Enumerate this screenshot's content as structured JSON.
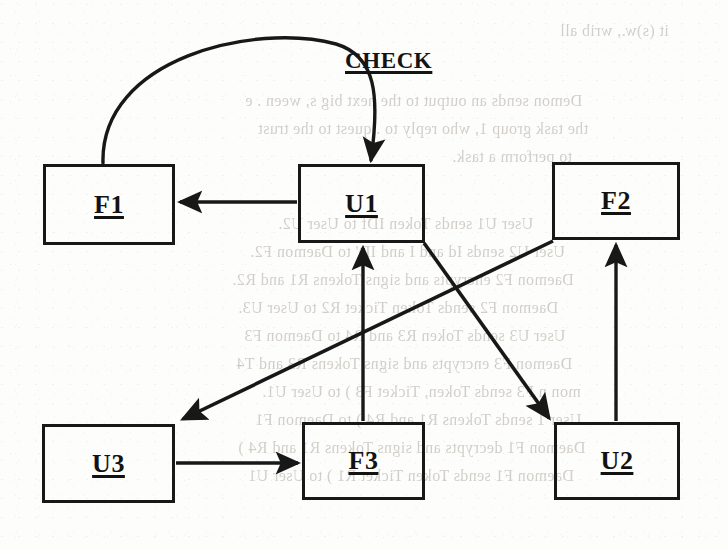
{
  "page": {
    "width": 728,
    "height": 549,
    "background_color": "#fdfdfb",
    "ink_color": "#181818",
    "bleed_color": "#b9b4ad"
  },
  "diagram": {
    "type": "flow-diagram",
    "title": "",
    "nodes": [
      {
        "id": "F1",
        "label": "F1",
        "x": 43,
        "y": 164,
        "w": 132,
        "h": 81,
        "underlined": true
      },
      {
        "id": "U1",
        "label": "U1",
        "x": 298,
        "y": 164,
        "w": 127,
        "h": 79,
        "underlined": true
      },
      {
        "id": "F2",
        "label": "F2",
        "x": 552,
        "y": 162,
        "w": 128,
        "h": 78,
        "underlined": true
      },
      {
        "id": "U3",
        "label": "U3",
        "x": 42,
        "y": 424,
        "w": 133,
        "h": 79,
        "underlined": true
      },
      {
        "id": "F3",
        "label": "F3",
        "x": 302,
        "y": 422,
        "w": 123,
        "h": 78,
        "underlined": true
      },
      {
        "id": "U2",
        "label": "U2",
        "x": 554,
        "y": 422,
        "w": 126,
        "h": 78,
        "underlined": true
      }
    ],
    "edges": [
      {
        "id": "e-f1-u1",
        "from": "F1",
        "to": "U1",
        "shape": "arc",
        "label": "CHECK",
        "arrowhead": "end"
      },
      {
        "id": "e-u1-f1",
        "from": "U1",
        "to": "F1",
        "shape": "horizontal",
        "label": "",
        "arrowhead": "end"
      },
      {
        "id": "e-f3-u1",
        "from": "F3",
        "to": "U1",
        "shape": "vertical",
        "label": "",
        "arrowhead": "end"
      },
      {
        "id": "e-f2-u3",
        "from": "F2",
        "to": "U3",
        "shape": "diagonal",
        "label": "",
        "arrowhead": "end"
      },
      {
        "id": "e-u1-u2",
        "from": "U1",
        "to": "U2",
        "shape": "diagonal",
        "label": "",
        "arrowhead": "end"
      },
      {
        "id": "e-u2-f2",
        "from": "U2",
        "to": "F2",
        "shape": "vertical",
        "label": "",
        "arrowhead": "end"
      },
      {
        "id": "e-u3-f3",
        "from": "U3",
        "to": "F3",
        "shape": "horizontal",
        "label": "",
        "arrowhead": "end"
      }
    ],
    "edge_labels": {
      "check": "CHECK"
    }
  },
  "bleed_through_text": [
    {
      "text": "it (s)w., wrib all",
      "x": 560,
      "y": 22,
      "size": 16
    },
    {
      "text": "Demon sends an output to the next big s, ween .  e",
      "x": 245,
      "y": 92,
      "size": 16
    },
    {
      "text": "the task group 1, who reply to .   quest to the trust",
      "x": 258,
      "y": 120,
      "size": 16
    },
    {
      "text": "to perform a task.",
      "x": 452,
      "y": 148,
      "size": 16
    },
    {
      "text": "User U1 sends Token IDf to User U2.",
      "x": 278,
      "y": 215,
      "size": 16
    },
    {
      "text": "User U2 sends Id and I  and ID' to Daemon F2.",
      "x": 250,
      "y": 243,
      "size": 16
    },
    {
      "text": "Daemon F2 encrypts and signs Tokens R1  and R2.",
      "x": 232,
      "y": 271,
      "size": 16
    },
    {
      "text": "Daemon F2 sends Token Ticket  R2   to User U3.",
      "x": 238,
      "y": 299,
      "size": 16
    },
    {
      "text": "User U3 sends Token  R3  and R4  to Daemon F3",
      "x": 244,
      "y": 327,
      "size": 16
    },
    {
      "text": "Daemon F3 encrypts and signs Tokens R3  and T4",
      "x": 236,
      "y": 355,
      "size": 16
    },
    {
      "text": "mon n F3 sends Token, Ticket  F3 ) to User U1.",
      "x": 262,
      "y": 383,
      "size": 16
    },
    {
      "text": "User 1 sends Tokens R1 and  R4 ) to Daemon F1",
      "x": 255,
      "y": 411,
      "size": 16
    },
    {
      "text": "Daemon F1 decrypts and signs Tokens R1 and  R4 )",
      "x": 238,
      "y": 439,
      "size": 16
    },
    {
      "text": "Daemon F1 sends Token Ticket  R1 ) to User U1",
      "x": 248,
      "y": 467,
      "size": 16
    }
  ]
}
